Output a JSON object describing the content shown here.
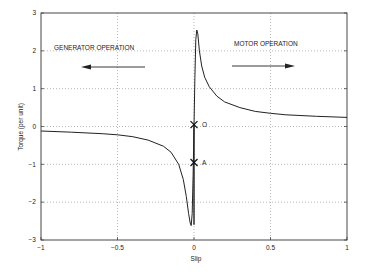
{
  "chart_data": {
    "type": "line",
    "title": "",
    "xlabel": "Slip",
    "ylabel": "Torque (per unit)",
    "xlim": [
      -1,
      1
    ],
    "ylim": [
      -3,
      3
    ],
    "grid": true,
    "xticks": [
      "-1",
      "-0.5",
      "0",
      "0.5",
      "1"
    ],
    "yticks": [
      "3",
      "2",
      "1",
      "0",
      "-1",
      "-2",
      "-3"
    ],
    "series": [
      {
        "name": "Torque-slip characteristic",
        "x": [
          -1,
          -0.8,
          -0.6,
          -0.5,
          -0.4,
          -0.3,
          -0.2,
          -0.15,
          -0.1,
          -0.07,
          -0.05,
          -0.035,
          -0.025,
          -0.018,
          -0.012,
          -0.006,
          0,
          0.006,
          0.012,
          0.018,
          0.025,
          0.035,
          0.05,
          0.07,
          0.1,
          0.15,
          0.2,
          0.3,
          0.4,
          0.5,
          0.6,
          0.8,
          1
        ],
        "values": [
          -0.12,
          -0.15,
          -0.19,
          -0.22,
          -0.27,
          -0.36,
          -0.52,
          -0.68,
          -1.0,
          -1.4,
          -1.85,
          -2.3,
          -2.55,
          -2.62,
          -2.3,
          -1.3,
          0,
          1.3,
          2.3,
          2.55,
          2.45,
          2.0,
          1.6,
          1.3,
          1.05,
          0.8,
          0.65,
          0.5,
          0.4,
          0.35,
          0.31,
          0.27,
          0.24
        ]
      }
    ],
    "markers": [
      {
        "label": "O",
        "x": 0,
        "y": 0.05,
        "symbol": "x"
      },
      {
        "label": "A",
        "x": 0,
        "y": -0.95,
        "symbol": "x"
      }
    ],
    "vertical_segment": {
      "x": 0,
      "y_from": 0.05,
      "y_to": -2.6
    },
    "annotations": [
      {
        "text": "GENERATOR OPERATION",
        "x": -0.75,
        "y": 2.0,
        "arrow": "left"
      },
      {
        "text": "MOTOR OPERATION",
        "x": 0.2,
        "y": 2.05,
        "arrow": "right"
      }
    ]
  },
  "labels": {
    "xlabel": "Slip",
    "ylabel": "Torque (per unit)",
    "generator": "GENERATOR OPERATION",
    "motor": "MOTOR OPERATION",
    "marker_o": "O",
    "marker_a": "A"
  }
}
